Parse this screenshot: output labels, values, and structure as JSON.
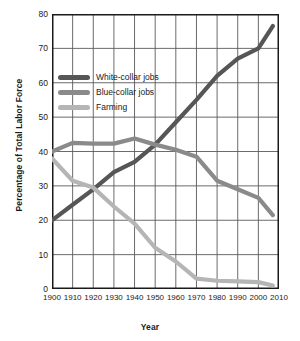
{
  "chart_data": {
    "type": "line",
    "title": "",
    "xlabel": "Year",
    "ylabel": "Percentage of Total Labor Force",
    "xlim": [
      1900,
      2010
    ],
    "ylim": [
      0,
      80
    ],
    "xticks": [
      1900,
      1910,
      1920,
      1930,
      1940,
      1950,
      1960,
      1970,
      1980,
      1990,
      2000,
      2010
    ],
    "yticks": [
      0,
      10,
      20,
      30,
      40,
      50,
      60,
      70,
      80
    ],
    "grid": true,
    "legend_position": "upper-left-inside",
    "x": [
      1900,
      1910,
      1920,
      1930,
      1940,
      1950,
      1960,
      1970,
      1980,
      1990,
      2000,
      2007
    ],
    "series": [
      {
        "name": "White-collar jobs",
        "color": "#565656",
        "values": [
          20.0,
          24.5,
          29.0,
          34.0,
          37.0,
          42.0,
          48.5,
          55.0,
          62.0,
          67.0,
          70.0,
          76.5
        ]
      },
      {
        "name": "Blue-collar jobs",
        "color": "#8a8a8a",
        "values": [
          40.0,
          42.5,
          42.3,
          42.3,
          43.8,
          42.0,
          40.5,
          38.5,
          31.5,
          29.0,
          26.5,
          21.5
        ]
      },
      {
        "name": "Farming",
        "color": "#b5b5b5",
        "values": [
          38.0,
          31.5,
          29.5,
          24.0,
          19.0,
          12.0,
          8.0,
          3.0,
          2.4,
          2.2,
          2.0,
          1.0
        ]
      }
    ]
  },
  "legend": {
    "items": [
      {
        "label": "White-collar jobs",
        "color": "#565656"
      },
      {
        "label": "Blue-collar jobs",
        "color": "#8a8a8a"
      },
      {
        "label": "Farming",
        "color": "#b5b5b5"
      }
    ]
  },
  "axes": {
    "y_title": "Percentage of Total Labor Force",
    "x_title": "Year"
  },
  "colors": {
    "axis": "#1a1a1a",
    "grid": "#5a5a5a",
    "background": "#ffffff"
  }
}
